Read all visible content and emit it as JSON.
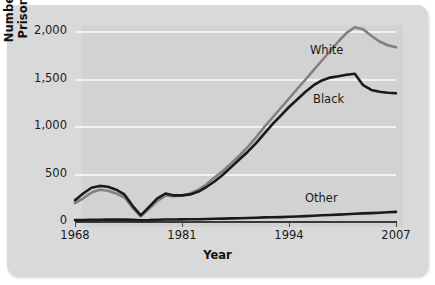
{
  "chart_data": {
    "type": "line",
    "title": "",
    "xlabel": "Year",
    "ylabel": "Number of Prisoners",
    "xlim": [
      1968,
      2007
    ],
    "ylim": [
      0,
      2150
    ],
    "grid": true,
    "grid_axis": "y",
    "legend": "inline-labels",
    "xticks": [
      "1968",
      "1981",
      "1994",
      "2007"
    ],
    "xtick_values": [
      1968,
      1981,
      1994,
      2007
    ],
    "yticks": [
      "0",
      "500",
      "1,000",
      "1,500",
      "2,000"
    ],
    "ytick_values": [
      0,
      500,
      1000,
      1500,
      2000
    ],
    "x": [
      1968,
      1969,
      1970,
      1971,
      1972,
      1973,
      1974,
      1975,
      1976,
      1977,
      1978,
      1979,
      1980,
      1981,
      1982,
      1983,
      1984,
      1985,
      1986,
      1987,
      1988,
      1989,
      1990,
      1991,
      1992,
      1993,
      1994,
      1995,
      1996,
      1997,
      1998,
      1999,
      2000,
      2001,
      2002,
      2003,
      2004,
      2005,
      2006,
      2007
    ],
    "series": [
      {
        "name": "White",
        "color": "#808080",
        "label_position": "upper-right",
        "values": [
          200,
          250,
          310,
          340,
          330,
          300,
          260,
          150,
          60,
          140,
          220,
          280,
          270,
          280,
          300,
          340,
          400,
          470,
          540,
          620,
          700,
          790,
          890,
          1000,
          1100,
          1200,
          1300,
          1400,
          1500,
          1600,
          1700,
          1800,
          1900,
          1990,
          2050,
          2030,
          1960,
          1900,
          1860,
          1840
        ]
      },
      {
        "name": "Black",
        "color": "#1a1a1a",
        "label_position": "middle-right",
        "values": [
          230,
          300,
          360,
          380,
          370,
          340,
          290,
          170,
          70,
          160,
          250,
          300,
          280,
          280,
          290,
          320,
          370,
          430,
          500,
          580,
          660,
          740,
          830,
          930,
          1030,
          1120,
          1210,
          1290,
          1370,
          1440,
          1490,
          1520,
          1535,
          1550,
          1560,
          1440,
          1390,
          1370,
          1360,
          1355
        ]
      },
      {
        "name": "Other",
        "color": "#1a1a1a",
        "label_position": "lower-right",
        "values": [
          20,
          20,
          22,
          24,
          25,
          25,
          25,
          22,
          18,
          20,
          24,
          26,
          26,
          27,
          28,
          30,
          32,
          34,
          36,
          38,
          40,
          42,
          45,
          48,
          50,
          52,
          55,
          58,
          62,
          66,
          70,
          74,
          78,
          82,
          86,
          90,
          94,
          98,
          102,
          106
        ]
      }
    ]
  },
  "axis": {
    "y_title": "Number of Prisoners",
    "x_title": "Year"
  }
}
